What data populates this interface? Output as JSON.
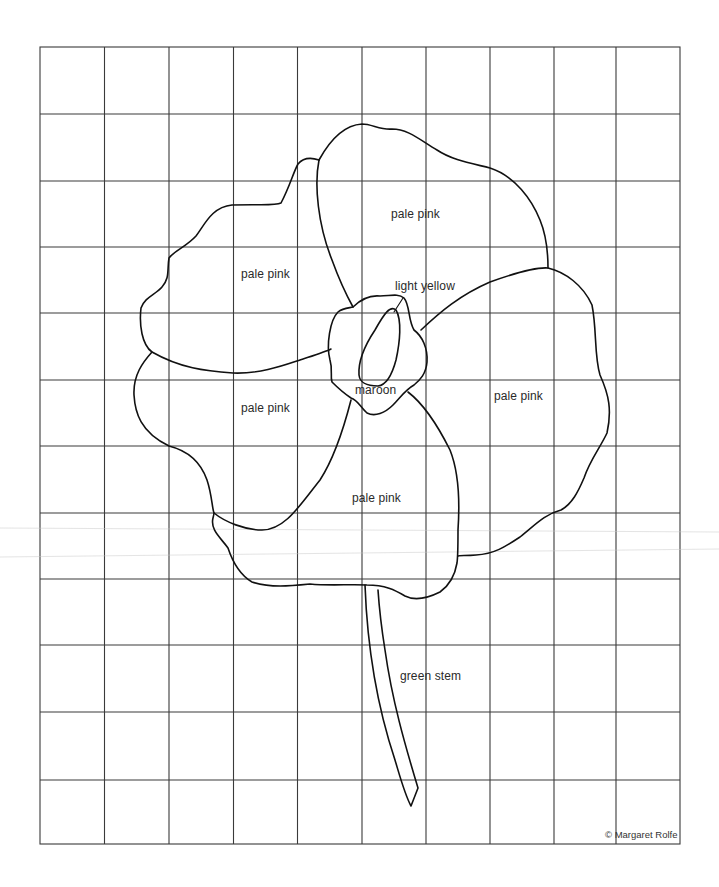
{
  "pattern": {
    "subject": "poppy flower",
    "grid": {
      "columns": 10,
      "rows": 12,
      "left": 40,
      "top": 47,
      "right": 680,
      "bottom": 844,
      "line_color": "#3a3a3a"
    },
    "outline_color": "#111111",
    "labels": {
      "upper_petal": "pale pink",
      "left_upper_petal": "pale pink",
      "center_highlight": "light yellow",
      "center": "maroon",
      "left_lower_petal": "pale pink",
      "right_petal": "pale pink",
      "bottom_petal": "pale pink",
      "stem": "green stem"
    },
    "credit": "© Margaret Rolfe"
  }
}
